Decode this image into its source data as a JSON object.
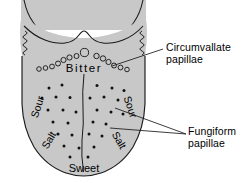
{
  "figure": {
    "background_color": "#ffffff",
    "tongue_fill_color": "#c8c8c8",
    "outline_color": "#1a1a1a",
    "papillae_dot_color": "#111111"
  },
  "annotations": {
    "circumvallate": {
      "line1": "Circumvallate",
      "line2": "papillae"
    },
    "fungiform": {
      "line1": "Fungiform",
      "line2": "papillae"
    }
  },
  "taste_regions": [
    {
      "id": "bitter",
      "label": "Bitter",
      "position": "posterior-center"
    },
    {
      "id": "sour-left",
      "label": "Sour",
      "position": "left-lateral-upper"
    },
    {
      "id": "sour-right",
      "label": "Sour",
      "position": "right-lateral-upper"
    },
    {
      "id": "salt-left",
      "label": "Salt",
      "position": "left-lateral-lower"
    },
    {
      "id": "salt-right",
      "label": "Salt",
      "position": "right-lateral-lower"
    },
    {
      "id": "sweet",
      "label": "Sweet",
      "position": "anterior-tip"
    }
  ],
  "chart_data": {
    "type": "diagram",
    "circumvallate_papillae": {
      "symbol": "open-circle",
      "count": 17,
      "points": [
        {
          "x": 39.0,
          "y": 69.0,
          "r": 2.3
        },
        {
          "x": 45.5,
          "y": 68.0,
          "r": 2.3
        },
        {
          "x": 52.0,
          "y": 66.5,
          "r": 2.4
        },
        {
          "x": 58.0,
          "y": 63.5,
          "r": 2.5
        },
        {
          "x": 63.5,
          "y": 60.0,
          "r": 2.6
        },
        {
          "x": 69.5,
          "y": 57.5,
          "r": 2.6
        },
        {
          "x": 76.5,
          "y": 56.0,
          "r": 2.5
        },
        {
          "x": 84.5,
          "y": 52.5,
          "r": 4.1
        },
        {
          "x": 96.5,
          "y": 56.0,
          "r": 2.7
        },
        {
          "x": 103.0,
          "y": 58.5,
          "r": 2.7
        },
        {
          "x": 108.5,
          "y": 62.0,
          "r": 2.6
        },
        {
          "x": 114.0,
          "y": 65.5,
          "r": 2.5
        },
        {
          "x": 120.5,
          "y": 67.5,
          "r": 2.4
        },
        {
          "x": 127.0,
          "y": 69.5,
          "r": 2.3
        }
      ]
    },
    "fungiform_papillae": {
      "symbol": "filled-dot",
      "radius": 1.5,
      "points": [
        {
          "x": 49.0,
          "y": 88.0
        },
        {
          "x": 62.0,
          "y": 85.0
        },
        {
          "x": 97.0,
          "y": 85.5
        },
        {
          "x": 112.0,
          "y": 88.0
        },
        {
          "x": 124.0,
          "y": 90.5
        },
        {
          "x": 42.0,
          "y": 98.0
        },
        {
          "x": 56.0,
          "y": 97.0
        },
        {
          "x": 70.0,
          "y": 97.5
        },
        {
          "x": 90.0,
          "y": 98.0
        },
        {
          "x": 104.0,
          "y": 97.0
        },
        {
          "x": 118.0,
          "y": 100.0
        },
        {
          "x": 48.0,
          "y": 110.0
        },
        {
          "x": 63.0,
          "y": 110.0
        },
        {
          "x": 76.0,
          "y": 112.0
        },
        {
          "x": 97.0,
          "y": 110.0
        },
        {
          "x": 111.0,
          "y": 112.0
        },
        {
          "x": 123.0,
          "y": 114.0
        },
        {
          "x": 53.0,
          "y": 122.0
        },
        {
          "x": 68.0,
          "y": 123.0
        },
        {
          "x": 93.0,
          "y": 122.0
        },
        {
          "x": 106.0,
          "y": 124.0
        },
        {
          "x": 58.0,
          "y": 134.0
        },
        {
          "x": 72.0,
          "y": 135.0
        },
        {
          "x": 89.0,
          "y": 134.0
        },
        {
          "x": 102.0,
          "y": 136.0
        },
        {
          "x": 64.0,
          "y": 146.0
        },
        {
          "x": 79.0,
          "y": 148.0
        },
        {
          "x": 94.0,
          "y": 147.0
        },
        {
          "x": 70.0,
          "y": 157.0
        },
        {
          "x": 88.0,
          "y": 157.0
        }
      ]
    },
    "leader_lines": [
      {
        "from": [
          163,
          49
        ],
        "to": [
          112,
          66
        ],
        "label": "circumvallate"
      },
      {
        "from": [
          186,
          134
        ],
        "to": [
          115,
          108
        ],
        "label": "fungiform"
      },
      {
        "from": [
          186,
          134
        ],
        "to": [
          110,
          128
        ],
        "label": "fungiform"
      }
    ]
  }
}
